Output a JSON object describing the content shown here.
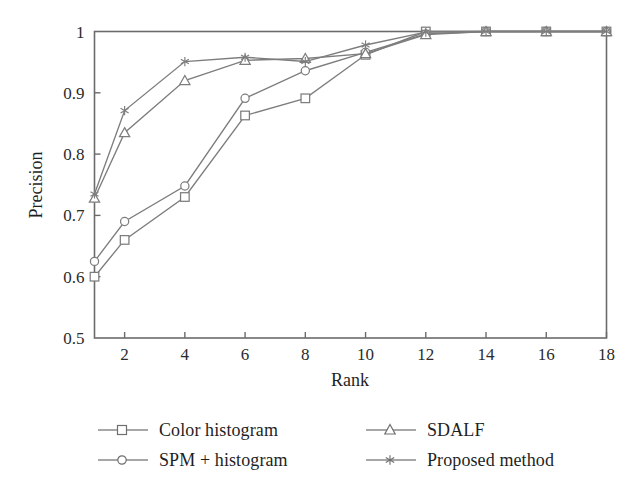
{
  "chart_data": {
    "type": "line",
    "title": "",
    "xlabel": "Rank",
    "ylabel": "Precision",
    "xlim": [
      1,
      18
    ],
    "ylim": [
      0.5,
      1.0
    ],
    "xticks": [
      2,
      4,
      6,
      8,
      10,
      12,
      14,
      16,
      18
    ],
    "yticks": [
      0.5,
      0.6,
      0.7,
      0.8,
      0.9,
      1
    ],
    "xticklabels": [
      "2",
      "4",
      "6",
      "8",
      "10",
      "12",
      "14",
      "16",
      "18"
    ],
    "yticklabels": [
      "0.5",
      "0.6",
      "0.7",
      "0.8",
      "0.9",
      "1"
    ],
    "grid": false,
    "legend_position": "below-plot",
    "x": [
      1,
      2,
      4,
      6,
      8,
      10,
      12,
      14,
      16,
      18
    ],
    "series": [
      {
        "name": "Color histogram",
        "marker": "square",
        "color": "#7d7d7d",
        "values": [
          0.6,
          0.66,
          0.73,
          0.863,
          0.891,
          0.962,
          1.0,
          1.0,
          1.0,
          1.0
        ]
      },
      {
        "name": "SPM + histogram",
        "marker": "circle",
        "color": "#7d7d7d",
        "values": [
          0.625,
          0.69,
          0.748,
          0.891,
          0.936,
          0.966,
          0.996,
          1.0,
          1.0,
          1.0
        ]
      },
      {
        "name": "SDALF",
        "marker": "triangle",
        "color": "#7d7d7d",
        "values": [
          0.728,
          0.835,
          0.92,
          0.953,
          0.956,
          0.964,
          0.995,
          1.0,
          1.0,
          1.0
        ]
      },
      {
        "name": "Proposed method",
        "marker": "star",
        "color": "#7d7d7d",
        "values": [
          0.735,
          0.871,
          0.951,
          0.958,
          0.951,
          0.978,
          0.999,
          1.0,
          1.0,
          1.0
        ]
      }
    ]
  },
  "axes": {
    "x_title": "Rank",
    "y_title": "Precision"
  },
  "legend": {
    "items": [
      {
        "label": "Color histogram",
        "marker": "square-marker"
      },
      {
        "label": "SDALF",
        "marker": "triangle-marker"
      },
      {
        "label": "SPM + histogram",
        "marker": "circle-marker"
      },
      {
        "label": "Proposed method",
        "marker": "star-marker"
      }
    ]
  },
  "colors": {
    "line": "#7d7d7d",
    "axis": "#6b6b6b",
    "text": "#1f1f1f",
    "background": "#ffffff"
  }
}
